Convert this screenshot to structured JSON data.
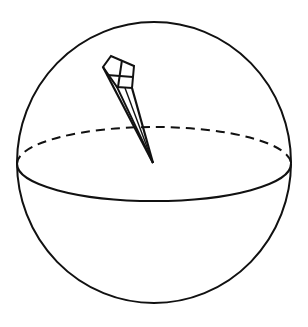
{
  "diagram": {
    "colors": {
      "stroke": "#111111",
      "background": "#ffffff"
    },
    "sphere": {
      "cx": 154,
      "cy": 162.5,
      "rx": 137,
      "ry": 140.5
    },
    "equator": {
      "cx": 154,
      "cy": 164,
      "rx": 137,
      "ry": 37,
      "back_style": "dashed",
      "front_style": "solid"
    },
    "pyramid": {
      "apex": [
        153,
        163
      ],
      "base_vertices": [
        [
          103,
          67
        ],
        [
          111,
          56
        ],
        [
          134,
          66
        ],
        [
          132,
          88
        ],
        [
          117,
          87
        ]
      ],
      "cross_lines": [
        [
          [
            122,
            61
          ],
          [
            118,
            86
          ]
        ],
        [
          [
            107,
            75
          ],
          [
            133,
            77
          ]
        ]
      ]
    }
  }
}
